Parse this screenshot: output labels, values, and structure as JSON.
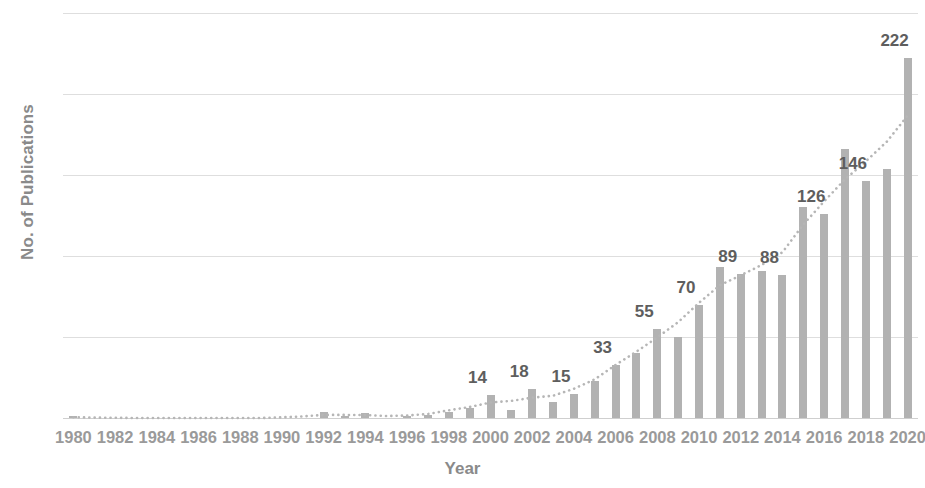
{
  "chart_data": {
    "type": "bar",
    "title": "",
    "xlabel": "Year",
    "ylabel": "No. of Publications",
    "ylim": [
      0,
      250
    ],
    "yticks": [
      0,
      50,
      100,
      150,
      200,
      250
    ],
    "grid": true,
    "legend": false,
    "bar_color": "#b2b2b2",
    "trendline": {
      "present": true,
      "style": "dotted",
      "color": "#b6b6b6",
      "description": "smooth dotted exponential trend rising from near 0 in 1980 to ~210 in 2020"
    },
    "xtick_labels": [
      "1980",
      "1982",
      "1984",
      "1986",
      "1988",
      "1990",
      "1992",
      "1994",
      "1996",
      "1998",
      "2000",
      "2002",
      "2004",
      "2006",
      "2008",
      "2010",
      "2012",
      "2014",
      "2016",
      "2018",
      "2020"
    ],
    "categories": [
      "1980",
      "1981",
      "1982",
      "1983",
      "1984",
      "1985",
      "1986",
      "1987",
      "1988",
      "1989",
      "1990",
      "1991",
      "1992",
      "1993",
      "1994",
      "1995",
      "1996",
      "1997",
      "1998",
      "1999",
      "2000",
      "2001",
      "2002",
      "2003",
      "2004",
      "2005",
      "2006",
      "2007",
      "2008",
      "2009",
      "2010",
      "2011",
      "2012",
      "2013",
      "2014",
      "2015",
      "2016",
      "2017",
      "2018",
      "2019",
      "2020"
    ],
    "values": [
      1,
      0,
      0,
      0,
      0,
      0,
      0,
      0,
      0,
      0,
      0,
      0,
      4,
      1,
      3,
      0,
      1,
      2,
      4,
      6,
      14,
      5,
      18,
      10,
      15,
      23,
      33,
      40,
      55,
      50,
      70,
      93,
      89,
      91,
      88,
      130,
      126,
      166,
      146,
      154,
      222
    ],
    "data_labels": [
      {
        "year": "2000",
        "value": 14
      },
      {
        "year": "2002",
        "value": 18
      },
      {
        "year": "2004",
        "value": 15
      },
      {
        "year": "2006",
        "value": 33
      },
      {
        "year": "2008",
        "value": 55
      },
      {
        "year": "2010",
        "value": 70
      },
      {
        "year": "2012",
        "value": 89
      },
      {
        "year": "2014",
        "value": 88
      },
      {
        "year": "2016",
        "value": 126
      },
      {
        "year": "2018",
        "value": 146
      },
      {
        "year": "2020",
        "value": 222
      }
    ]
  }
}
